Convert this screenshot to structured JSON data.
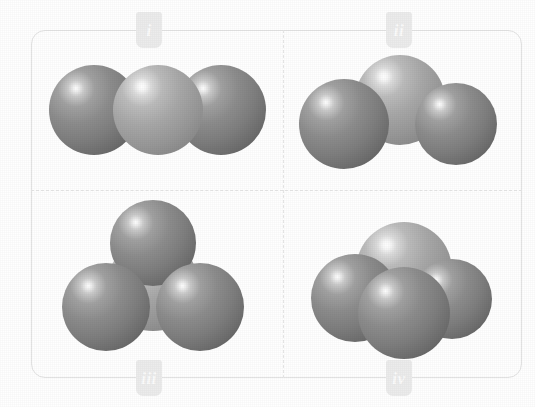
{
  "figure": {
    "frame_color": "#e3e3e3",
    "divider_color": "#e6e6e6",
    "background": "#ffffff"
  },
  "legend": {
    "dark_atom_color": "#7e7e7e",
    "light_atom_color": "#9a9a9a"
  },
  "panels": [
    {
      "id": "i",
      "label": "i",
      "label_position": "top",
      "geometry": "linear",
      "description": "Linear triatomic model: light central sphere flanked by two dark spheres in a straight row",
      "atom_count": 3,
      "atoms": [
        {
          "role": "terminal",
          "shade": "dark",
          "cx": 94,
          "cy": 110,
          "r": 45
        },
        {
          "role": "central",
          "shade": "light",
          "cx": 158,
          "cy": 110,
          "r": 45
        },
        {
          "role": "terminal",
          "shade": "dark",
          "cx": 221,
          "cy": 110,
          "r": 45
        }
      ]
    },
    {
      "id": "ii",
      "label": "ii",
      "label_position": "top",
      "geometry": "bent",
      "description": "Bent triatomic model: light central sphere raised above two lower dark spheres",
      "atom_count": 3,
      "atoms": [
        {
          "role": "central",
          "shade": "light",
          "cx": 400,
          "cy": 100,
          "r": 45
        },
        {
          "role": "terminal",
          "shade": "dark",
          "cx": 344,
          "cy": 124,
          "r": 45
        },
        {
          "role": "terminal",
          "shade": "dark",
          "cx": 456,
          "cy": 124,
          "r": 41
        }
      ]
    },
    {
      "id": "iii",
      "label": "iii",
      "label_position": "bottom",
      "geometry": "trigonal-planar",
      "description": "Trigonal planar model: three dark spheres arranged around a mostly hidden light central sphere",
      "atom_count": 4,
      "atoms": [
        {
          "role": "central",
          "shade": "light",
          "cx": 153,
          "cy": 285,
          "r": 46
        },
        {
          "role": "terminal",
          "shade": "dark",
          "cx": 153,
          "cy": 243,
          "r": 43
        },
        {
          "role": "terminal",
          "shade": "dark",
          "cx": 106,
          "cy": 307,
          "r": 44
        },
        {
          "role": "terminal",
          "shade": "dark",
          "cx": 200,
          "cy": 307,
          "r": 44
        }
      ]
    },
    {
      "id": "iv",
      "label": "iv",
      "label_position": "bottom",
      "geometry": "trigonal-pyramidal",
      "description": "Trigonal pyramidal model: large light sphere at rear with three dark spheres clustered in front",
      "atom_count": 4,
      "atoms": [
        {
          "role": "central",
          "shade": "light",
          "cx": 404,
          "cy": 270,
          "r": 48
        },
        {
          "role": "terminal",
          "shade": "dark",
          "cx": 355,
          "cy": 298,
          "r": 44
        },
        {
          "role": "terminal",
          "shade": "dark",
          "cx": 452,
          "cy": 299,
          "r": 40
        },
        {
          "role": "terminal",
          "shade": "dark",
          "cx": 404,
          "cy": 313,
          "r": 46
        }
      ]
    }
  ]
}
